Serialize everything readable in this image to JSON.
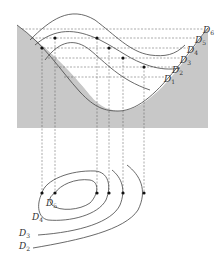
{
  "figure": {
    "right_labels": [
      {
        "base": "D",
        "sub": "6"
      },
      {
        "base": "D",
        "sub": "5"
      },
      {
        "base": "D",
        "sub": "4"
      },
      {
        "base": "D",
        "sub": "3"
      },
      {
        "base": "D",
        "sub": "2"
      },
      {
        "base": "D",
        "sub": "1"
      }
    ],
    "bottom_labels": [
      {
        "base": "D",
        "sub": "5"
      },
      {
        "base": "D",
        "sub": "4"
      },
      {
        "base": "D",
        "sub": "3"
      },
      {
        "base": "D",
        "sub": "2"
      }
    ],
    "colors": {
      "ground": "#c8c8c8",
      "line": "#444444",
      "dash": "#555555",
      "point": "#111111"
    }
  }
}
